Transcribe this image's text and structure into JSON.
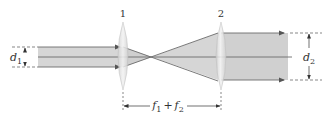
{
  "diagram": {
    "type": "beam-expander",
    "lenses": [
      {
        "id": "lens-1",
        "label": "1",
        "x": 123
      },
      {
        "id": "lens-2",
        "label": "2",
        "x": 221
      }
    ],
    "input_beam": {
      "label_var": "d",
      "label_sub": "1"
    },
    "output_beam": {
      "label_var": "d",
      "label_sub": "2"
    },
    "separation": {
      "f1_var": "f",
      "f1_sub": "1",
      "plus": "+",
      "f2_var": "f",
      "f2_sub": "2"
    },
    "colors": {
      "beam_fill": "#d4d4d4",
      "beam_edge": "#6b6b6b",
      "lens_fill": "#e6e6e6",
      "lens_edge": "#bdbdbd",
      "dim_line": "#444444",
      "text": "#333333"
    }
  }
}
